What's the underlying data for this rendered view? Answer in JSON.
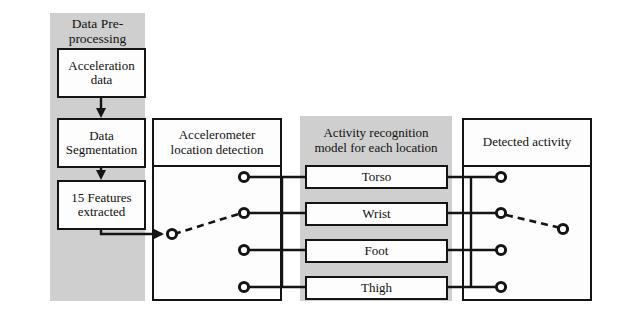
{
  "diagram": {
    "colors": {
      "panel_grey": "#cfcfcf",
      "box_fill": "#fdfdfd",
      "stroke": "#141414",
      "page_background": "#ffffff"
    },
    "panels": [
      {
        "id": "preprocessing",
        "label": "Data Pre-\nprocessing"
      },
      {
        "id": "location-detection",
        "label": "Accelerometer location detection"
      },
      {
        "id": "recognition-model",
        "label": "Activity recognition model for each location"
      },
      {
        "id": "detected-activity",
        "label": "Detected activity"
      }
    ],
    "preprocessing": {
      "heading_line1": "Data Pre-",
      "heading_line2": "processing",
      "steps": [
        {
          "line1": "Acceleration",
          "line2": "data"
        },
        {
          "line1": "Data",
          "line2": "Segmentation"
        },
        {
          "line1": "15 Features",
          "line2": "extracted"
        }
      ]
    },
    "location_detection": {
      "heading_line1": "Accelerometer",
      "heading_line2": "location detection",
      "node_count": 4,
      "input_node_label": "input",
      "selected_node_index": 1
    },
    "recognition_model": {
      "heading_line1": "Activity recognition",
      "heading_line2": "model for each location",
      "locations": [
        "Torso",
        "Wrist",
        "Foot",
        "Thigh"
      ]
    },
    "detected_activity": {
      "heading": "Detected activity",
      "node_count": 4,
      "selected_node_index": 1,
      "output_node_label": "output"
    }
  }
}
